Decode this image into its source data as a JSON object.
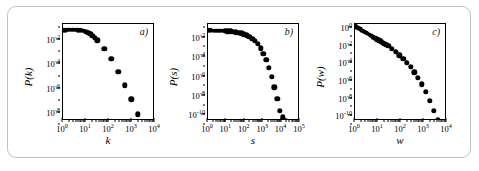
{
  "figure": {
    "border_color": "#b9c4cc",
    "background": "#ffffff",
    "marker_color": "#000000",
    "panel_count": 3
  },
  "chart_data": [
    {
      "type": "scatter",
      "panel_label": "a)",
      "title": "",
      "xlabel": "k",
      "ylabel": "P(k)",
      "xscale": "log",
      "yscale": "log",
      "xlim": [
        1,
        10000
      ],
      "ylim": [
        1e-09,
        0.1
      ],
      "xticks": [
        1,
        10,
        100,
        1000,
        10000
      ],
      "xticklabels": [
        "10",
        "10",
        "10",
        "10",
        "10"
      ],
      "xtickexps": [
        "0",
        "1",
        "2",
        "3",
        "4"
      ],
      "yticks": [
        0.01,
        0.0001,
        1e-06,
        1e-08
      ],
      "yticklabels": [
        "10",
        "10",
        "10",
        "10"
      ],
      "ytickexps": [
        "-2",
        "-4",
        "-6",
        "-8"
      ],
      "grid": false,
      "legend": "none",
      "x": [
        1.0,
        1.3,
        1.7,
        2.2,
        2.8,
        3.6,
        4.6,
        6.0,
        7.7,
        10.0,
        12.5,
        15.5,
        19.0,
        24.0,
        31.0,
        62.0,
        125.0,
        250.0,
        500.0,
        950.0,
        1800.0,
        3400.0
      ],
      "y": [
        0.03,
        0.032,
        0.033,
        0.034,
        0.034,
        0.033,
        0.032,
        0.03,
        0.027,
        0.023,
        0.019,
        0.015,
        0.011,
        0.0075,
        0.0045,
        0.00095,
        0.00013,
        1.2e-05,
        9e-07,
        6e-08,
        3.5e-09,
        2.5e-10
      ]
    },
    {
      "type": "scatter",
      "panel_label": "b)",
      "title": "",
      "xlabel": "s",
      "ylabel": "P(s)",
      "xscale": "log",
      "yscale": "log",
      "xlim": [
        1,
        100000
      ],
      "ylim": [
        1e-11,
        0.1
      ],
      "xticks": [
        1,
        10,
        100,
        1000,
        10000,
        100000
      ],
      "xticklabels": [
        "10",
        "10",
        "10",
        "10",
        "10",
        "10"
      ],
      "xtickexps": [
        "0",
        "1",
        "2",
        "3",
        "4",
        "5"
      ],
      "yticks": [
        0.01,
        0.0001,
        1e-06,
        1e-08,
        1e-10
      ],
      "yticklabels": [
        "10",
        "10",
        "10",
        "10",
        "10"
      ],
      "ytickexps": [
        "-2",
        "-4",
        "-6",
        "-8",
        "-10"
      ],
      "grid": false,
      "legend": "none",
      "x": [
        1.0,
        1.4,
        2.0,
        2.8,
        4.0,
        5.6,
        8.0,
        11.0,
        16.0,
        22.0,
        32.0,
        45.0,
        64.0,
        90.0,
        128.0,
        180.0,
        256.0,
        360.0,
        512.0,
        720.0,
        1024.0,
        1450.0,
        2048.0,
        2900.0,
        4100.0,
        5800.0,
        8200.0,
        12000.0,
        17000.0,
        24000.0
      ],
      "y": [
        0.022,
        0.022,
        0.021,
        0.021,
        0.02,
        0.02,
        0.019,
        0.018,
        0.017,
        0.016,
        0.014,
        0.013,
        0.011,
        0.009,
        0.007,
        0.005,
        0.0032,
        0.0018,
        0.00085,
        0.00032,
        9e-05,
        2e-05,
        3e-06,
        3.5e-07,
        3e-08,
        2e-09,
        1.2e-10,
        2.5e-11,
        1e-11,
        5e-12
      ]
    },
    {
      "type": "scatter",
      "panel_label": "c)",
      "title": "",
      "xlabel": "w",
      "ylabel": "P(w)",
      "xscale": "log",
      "yscale": "log",
      "xlim": [
        1,
        10000
      ],
      "ylim": [
        1e-11,
        1
      ],
      "xticks": [
        1,
        10,
        100,
        1000,
        10000
      ],
      "xticklabels": [
        "10",
        "10",
        "10",
        "10",
        "10"
      ],
      "xtickexps": [
        "0",
        "1",
        "2",
        "3",
        "4"
      ],
      "yticks": [
        1,
        0.01,
        0.0001,
        1e-06,
        1e-08,
        1e-10
      ],
      "yticklabels": [
        "10",
        "10",
        "10",
        "10",
        "10",
        "10"
      ],
      "ytickexps": [
        "0",
        "-2",
        "-4",
        "-6",
        "-8",
        "-10"
      ],
      "grid": false,
      "legend": "none",
      "x": [
        1.0,
        1.2,
        1.45,
        1.75,
        2.1,
        2.5,
        3.0,
        3.6,
        4.3,
        5.2,
        6.2,
        7.5,
        9.0,
        11.0,
        13.0,
        16.0,
        19.0,
        23.0,
        28.0,
        40.0,
        58.0,
        85.0,
        125.0,
        180.0,
        260.0,
        380.0,
        550.0,
        800.0,
        1200.0,
        1800.0,
        2700.0,
        4000.0,
        6000.0,
        8500.0
      ],
      "y": [
        0.55,
        0.42,
        0.32,
        0.24,
        0.18,
        0.14,
        0.105,
        0.08,
        0.06,
        0.045,
        0.034,
        0.026,
        0.019,
        0.014,
        0.0105,
        0.0078,
        0.0058,
        0.0043,
        0.0032,
        0.0015,
        0.00065,
        0.00028,
        0.00011,
        4e-05,
        1.3e-05,
        3.5e-06,
        8e-07,
        1.5e-07,
        2e-08,
        2e-09,
        1.5e-10,
        1.2e-11,
        4e-12,
        1.5e-12
      ]
    }
  ]
}
